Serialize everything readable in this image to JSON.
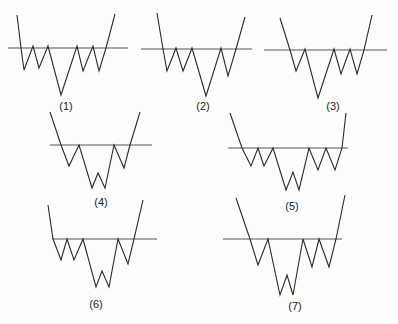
{
  "diagram": {
    "stroke_color": "#2a2a2a",
    "neckline_color": "#555555",
    "patterns": [
      {
        "label": "(1)",
        "label_pos": [
          66,
          100
        ],
        "neckline": [
          [
            8,
            48
          ],
          [
            128,
            48
          ]
        ],
        "path": [
          [
            17,
            15
          ],
          [
            21,
            48
          ],
          [
            24,
            70
          ],
          [
            33,
            46
          ],
          [
            39,
            68
          ],
          [
            48,
            46
          ],
          [
            61,
            95
          ],
          [
            77,
            46
          ],
          [
            83,
            71
          ],
          [
            93,
            46
          ],
          [
            99,
            71
          ],
          [
            106,
            48
          ],
          [
            115,
            14
          ]
        ]
      },
      {
        "label": "(2)",
        "label_pos": [
          203,
          100
        ],
        "neckline": [
          [
            141,
            49
          ],
          [
            252,
            49
          ]
        ],
        "path": [
          [
            157,
            13
          ],
          [
            163,
            49
          ],
          [
            167,
            71
          ],
          [
            176,
            48
          ],
          [
            183,
            71
          ],
          [
            192,
            48
          ],
          [
            206,
            96
          ],
          [
            221,
            48
          ],
          [
            228,
            76
          ],
          [
            236,
            49
          ],
          [
            245,
            17
          ]
        ]
      },
      {
        "label": "(3)",
        "label_pos": [
          333,
          100
        ],
        "neckline": [
          [
            264,
            50
          ],
          [
            387,
            50
          ]
        ],
        "path": [
          [
            280,
            18
          ],
          [
            290,
            50
          ],
          [
            296,
            71
          ],
          [
            305,
            49
          ],
          [
            318,
            98
          ],
          [
            334,
            49
          ],
          [
            341,
            74
          ],
          [
            350,
            49
          ],
          [
            357,
            74
          ],
          [
            364,
            50
          ],
          [
            372,
            15
          ]
        ]
      },
      {
        "label": "(4)",
        "label_pos": [
          101,
          196
        ],
        "neckline": [
          [
            50,
            145
          ],
          [
            152,
            145
          ]
        ],
        "path": [
          [
            50,
            112
          ],
          [
            61,
            145
          ],
          [
            69,
            166
          ],
          [
            79,
            145
          ],
          [
            92,
            188
          ],
          [
            98,
            173
          ],
          [
            105,
            188
          ],
          [
            114,
            145
          ],
          [
            124,
            168
          ],
          [
            130,
            145
          ],
          [
            140,
            112
          ]
        ]
      },
      {
        "label": "(5)",
        "label_pos": [
          292,
          200
        ],
        "neckline": [
          [
            228,
            148
          ],
          [
            348,
            148
          ]
        ],
        "path": [
          [
            230,
            113
          ],
          [
            242,
            148
          ],
          [
            251,
            166
          ],
          [
            258,
            148
          ],
          [
            264,
            166
          ],
          [
            273,
            148
          ],
          [
            286,
            190
          ],
          [
            293,
            172
          ],
          [
            299,
            190
          ],
          [
            309,
            148
          ],
          [
            318,
            170
          ],
          [
            326,
            148
          ],
          [
            335,
            170
          ],
          [
            342,
            148
          ],
          [
            346,
            113
          ]
        ]
      },
      {
        "label": "(6)",
        "label_pos": [
          96,
          298
        ],
        "neckline": [
          [
            52,
            239
          ],
          [
            157,
            239
          ]
        ],
        "path": [
          [
            48,
            205
          ],
          [
            53,
            239
          ],
          [
            61,
            260
          ],
          [
            67,
            239
          ],
          [
            74,
            260
          ],
          [
            83,
            239
          ],
          [
            96,
            287
          ],
          [
            102,
            271
          ],
          [
            109,
            287
          ],
          [
            118,
            239
          ],
          [
            128,
            264
          ],
          [
            134,
            239
          ],
          [
            143,
            200
          ]
        ]
      },
      {
        "label": "(7)",
        "label_pos": [
          295,
          300
        ],
        "neckline": [
          [
            223,
            239
          ],
          [
            342,
            239
          ]
        ],
        "path": [
          [
            236,
            198
          ],
          [
            250,
            239
          ],
          [
            258,
            265
          ],
          [
            268,
            239
          ],
          [
            280,
            295
          ],
          [
            287,
            275
          ],
          [
            293,
            295
          ],
          [
            303,
            239
          ],
          [
            312,
            267
          ],
          [
            319,
            239
          ],
          [
            329,
            267
          ],
          [
            336,
            239
          ],
          [
            345,
            195
          ]
        ]
      }
    ]
  }
}
